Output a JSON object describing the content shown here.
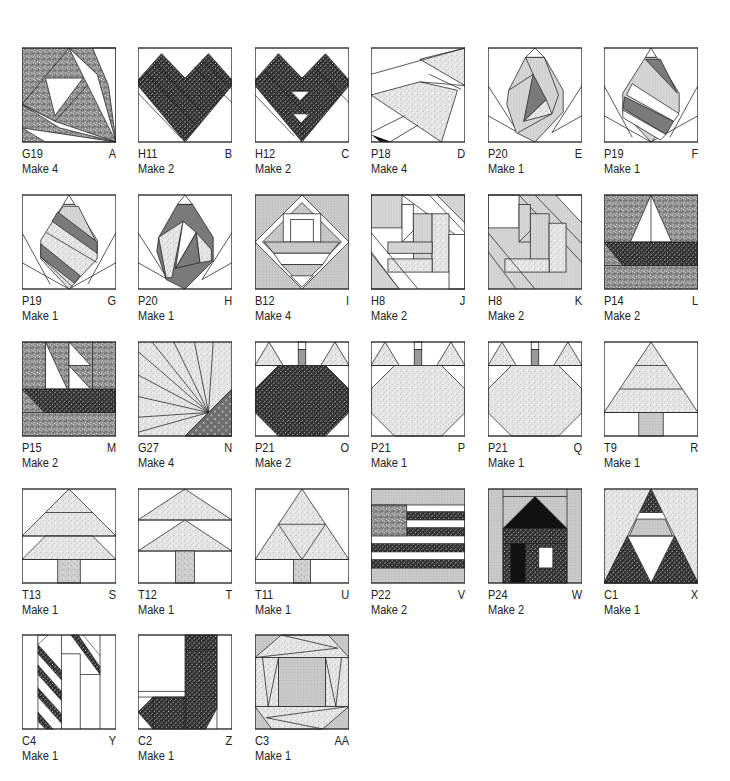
{
  "page": {
    "type": "quilt block cutting guide",
    "colors": {
      "outline": "#222222",
      "speckle_dark": "#8a8a8a",
      "speckle_light": "#e4e4e4",
      "check_dark": "#3a3a3a",
      "medium_gray": "#7a7a7a",
      "grid_gray": "#c8c8c8"
    }
  },
  "blocks": [
    {
      "id": "A",
      "code": "G19",
      "make": "Make 4",
      "design": "fan-flower"
    },
    {
      "id": "B",
      "code": "H11",
      "make": "Make 2",
      "design": "heart"
    },
    {
      "id": "C",
      "code": "H12",
      "make": "Make 2",
      "design": "heart-with-gaps"
    },
    {
      "id": "D",
      "code": "P18",
      "make": "Make 4",
      "design": "pinwheel-wedge"
    },
    {
      "id": "E",
      "code": "P20",
      "make": "Make 1",
      "design": "tulip-swirl"
    },
    {
      "id": "F",
      "code": "P19",
      "make": "Make 1",
      "design": "tulip-striped"
    },
    {
      "id": "G",
      "code": "P19",
      "make": "Make 1",
      "design": "tulip-striped"
    },
    {
      "id": "H",
      "code": "P20",
      "make": "Make 1",
      "design": "tulip-swirl"
    },
    {
      "id": "I",
      "code": "B12",
      "make": "Make 4",
      "design": "basket-diamond"
    },
    {
      "id": "J",
      "code": "H8",
      "make": "Make 2",
      "design": "log-cabin-diagonal"
    },
    {
      "id": "K",
      "code": "H8",
      "make": "Make 2",
      "design": "log-cabin-diagonal"
    },
    {
      "id": "L",
      "code": "P14",
      "make": "Make 2",
      "design": "sailboat"
    },
    {
      "id": "M",
      "code": "P15",
      "make": "Make 2",
      "design": "sailboat-double"
    },
    {
      "id": "N",
      "code": "G27",
      "make": "Make 4",
      "design": "sunburst"
    },
    {
      "id": "O",
      "code": "P21",
      "make": "Make 2",
      "design": "pumpkin-dark"
    },
    {
      "id": "P",
      "code": "P21",
      "make": "Make 1",
      "design": "pumpkin-light"
    },
    {
      "id": "Q",
      "code": "P21",
      "make": "Make 1",
      "design": "pumpkin-light"
    },
    {
      "id": "R",
      "code": "T9",
      "make": "Make 1",
      "design": "tree-three-tier"
    },
    {
      "id": "S",
      "code": "T13",
      "make": "Make 1",
      "design": "tree-two-tier-tall"
    },
    {
      "id": "T",
      "code": "T12",
      "make": "Make 1",
      "design": "tree-two-tier-flat"
    },
    {
      "id": "U",
      "code": "T11",
      "make": "Make 1",
      "design": "tree-triangles"
    },
    {
      "id": "V",
      "code": "P22",
      "make": "Make 2",
      "design": "flag"
    },
    {
      "id": "W",
      "code": "P24",
      "make": "Make 2",
      "design": "house"
    },
    {
      "id": "X",
      "code": "C1",
      "make": "Make 1",
      "design": "triangle-tree"
    },
    {
      "id": "Y",
      "code": "C4",
      "make": "Make 1",
      "design": "candy-cane"
    },
    {
      "id": "Z",
      "code": "C2",
      "make": "Make 1",
      "design": "stocking"
    },
    {
      "id": "AA",
      "code": "C3",
      "make": "Make 1",
      "design": "twisted-frame"
    }
  ]
}
